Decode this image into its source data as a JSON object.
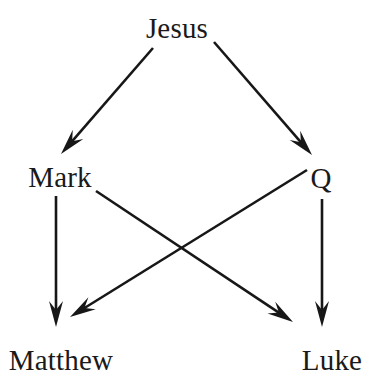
{
  "diagram": {
    "background_color": "#ffffff",
    "line_color": "#171717",
    "text_color": "#1a1a1a",
    "nodes": [
      {
        "id": "jesus",
        "label": "Jesus",
        "x": 177,
        "y": 38,
        "anchor": "middle"
      },
      {
        "id": "mark",
        "label": "Mark",
        "x": 60,
        "y": 187,
        "anchor": "middle"
      },
      {
        "id": "q",
        "label": "Q",
        "x": 321,
        "y": 188,
        "anchor": "middle"
      },
      {
        "id": "matthew",
        "label": "Matthew",
        "x": 61,
        "y": 370,
        "anchor": "middle"
      },
      {
        "id": "luke",
        "label": "Luke",
        "x": 332,
        "y": 370,
        "anchor": "middle"
      }
    ],
    "edges": [
      {
        "id": "jesus-to-mark",
        "from": "Jesus",
        "to": "Mark",
        "x1": 153,
        "y1": 48,
        "x2": 61,
        "y2": 154
      },
      {
        "id": "jesus-to-q",
        "from": "Jesus",
        "to": "Q",
        "x1": 214,
        "y1": 42,
        "x2": 312,
        "y2": 155
      },
      {
        "id": "mark-to-matthew",
        "from": "Mark",
        "to": "Matthew",
        "x1": 56,
        "y1": 196,
        "x2": 56,
        "y2": 327
      },
      {
        "id": "mark-to-luke",
        "from": "Mark",
        "to": "Luke",
        "x1": 96,
        "y1": 191,
        "x2": 293,
        "y2": 322
      },
      {
        "id": "q-to-matthew",
        "from": "Q",
        "to": "Matthew",
        "x1": 307,
        "y1": 170,
        "x2": 70,
        "y2": 317
      },
      {
        "id": "q-to-luke",
        "from": "Q",
        "to": "Luke",
        "x1": 322,
        "y1": 199,
        "x2": 322,
        "y2": 327
      }
    ]
  }
}
